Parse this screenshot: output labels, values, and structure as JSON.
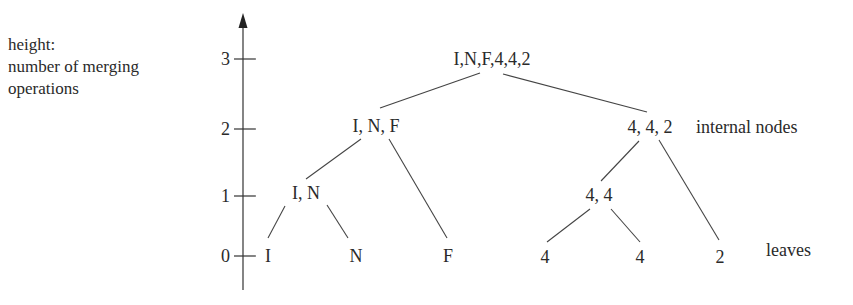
{
  "y_axis": {
    "label_lines": [
      "height:",
      "number of merging",
      "operations"
    ],
    "ticks": [
      "0",
      "1",
      "2",
      "3"
    ]
  },
  "annotations": {
    "internal_nodes": "internal nodes",
    "leaves": "leaves"
  },
  "tree": {
    "root": "I,N,F,4,4,2",
    "level2": [
      "I, N, F",
      "4, 4, 2"
    ],
    "level1": [
      "I, N",
      "4, 4"
    ],
    "leaves": [
      "I",
      "N",
      "F",
      "4",
      "4",
      "2"
    ]
  },
  "colors": {
    "ink": "#2a2a2a",
    "background": "#ffffff"
  }
}
